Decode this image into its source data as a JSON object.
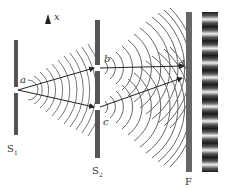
{
  "diagram": {
    "title": "",
    "axis_label": "x",
    "points": {
      "a": "a",
      "b": "b",
      "c": "c",
      "d": "d"
    },
    "barriers": [
      {
        "label": "S",
        "subscript": "1"
      },
      {
        "label": "S",
        "subscript": "2"
      },
      {
        "label": "F",
        "subscript": ""
      }
    ],
    "colors": {
      "barrier": "#555555",
      "wave": "#666666",
      "ray": "#333333",
      "fringe_dark": "#1a1a1a",
      "fringe_light": "#f0f0f0"
    },
    "fringe_count": 11
  }
}
